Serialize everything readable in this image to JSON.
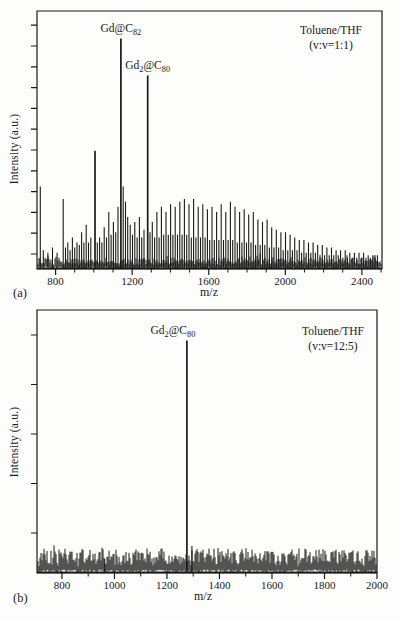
{
  "page": {
    "background": "#fdfdfb",
    "ink": "#1a1a1a",
    "figure_type": "MALDI-TOF mass spectra, two panels"
  },
  "panel_labels": {
    "a": "(a)",
    "b": "(b)"
  },
  "chart_data": [
    {
      "panel": "a",
      "type": "line",
      "kind": "mass-spectrum",
      "xlabel": "m/z",
      "ylabel": "Intensity (a.u.)",
      "xlim": [
        703,
        2505
      ],
      "ylim": [
        0,
        1
      ],
      "x_major_ticks": [
        800,
        1200,
        1600,
        2000,
        2400
      ],
      "x_minor_step": 100,
      "y_tick_count": 12,
      "y_tick_labels": [],
      "grid": false,
      "annotation": {
        "line1": "Toluene/THF",
        "line2": "(v:v=1:1)"
      },
      "labeled_peaks": [
        {
          "mz": 1141,
          "rel_intensity": 0.9,
          "label_text": "Gd@C82",
          "label_segments": [
            [
              "Gd",
              false
            ],
            [
              "@C",
              false
            ],
            [
              "82",
              true
            ]
          ]
        },
        {
          "mz": 1281,
          "rel_intensity": 0.755,
          "label_text": "Gd2@C80",
          "label_segments": [
            [
              "Gd",
              false
            ],
            [
              "2",
              true
            ],
            [
              "@C",
              false
            ],
            [
              "80",
              true
            ]
          ]
        }
      ],
      "noise_level": 0.035,
      "peaks_mz_intensity": [
        [
          720,
          0.32
        ],
        [
          736,
          0.07
        ],
        [
          760,
          0.06
        ],
        [
          784,
          0.08
        ],
        [
          808,
          0.06
        ],
        [
          840,
          0.27
        ],
        [
          852,
          0.08
        ],
        [
          864,
          0.1
        ],
        [
          876,
          0.07
        ],
        [
          888,
          0.12
        ],
        [
          900,
          0.08
        ],
        [
          912,
          0.1
        ],
        [
          924,
          0.09
        ],
        [
          936,
          0.14
        ],
        [
          948,
          0.1
        ],
        [
          960,
          0.17
        ],
        [
          972,
          0.1
        ],
        [
          984,
          0.12
        ],
        [
          1006,
          0.46
        ],
        [
          1018,
          0.1
        ],
        [
          1030,
          0.12
        ],
        [
          1042,
          0.1
        ],
        [
          1054,
          0.16
        ],
        [
          1066,
          0.12
        ],
        [
          1078,
          0.22
        ],
        [
          1090,
          0.13
        ],
        [
          1102,
          0.18
        ],
        [
          1114,
          0.14
        ],
        [
          1126,
          0.24
        ],
        [
          1141,
          0.9
        ],
        [
          1153,
          0.32
        ],
        [
          1165,
          0.26
        ],
        [
          1177,
          0.2
        ],
        [
          1190,
          0.17
        ],
        [
          1202,
          0.13
        ],
        [
          1214,
          0.18
        ],
        [
          1226,
          0.12
        ],
        [
          1238,
          0.2
        ],
        [
          1250,
          0.12
        ],
        [
          1262,
          0.15
        ],
        [
          1281,
          0.755
        ],
        [
          1293,
          0.14
        ],
        [
          1305,
          0.18
        ],
        [
          1317,
          0.12
        ],
        [
          1329,
          0.22
        ],
        [
          1341,
          0.12
        ],
        [
          1353,
          0.24
        ],
        [
          1365,
          0.13
        ],
        [
          1377,
          0.22
        ],
        [
          1389,
          0.13
        ],
        [
          1401,
          0.25
        ],
        [
          1413,
          0.13
        ],
        [
          1425,
          0.24
        ],
        [
          1437,
          0.13
        ],
        [
          1449,
          0.26
        ],
        [
          1461,
          0.13
        ],
        [
          1473,
          0.27
        ],
        [
          1485,
          0.13
        ],
        [
          1497,
          0.25
        ],
        [
          1509,
          0.12
        ],
        [
          1521,
          0.27
        ],
        [
          1533,
          0.12
        ],
        [
          1545,
          0.24
        ],
        [
          1557,
          0.12
        ],
        [
          1569,
          0.25
        ],
        [
          1581,
          0.12
        ],
        [
          1593,
          0.23
        ],
        [
          1605,
          0.11
        ],
        [
          1617,
          0.24
        ],
        [
          1629,
          0.11
        ],
        [
          1641,
          0.22
        ],
        [
          1653,
          0.11
        ],
        [
          1665,
          0.25
        ],
        [
          1677,
          0.11
        ],
        [
          1689,
          0.22
        ],
        [
          1701,
          0.11
        ],
        [
          1713,
          0.26
        ],
        [
          1725,
          0.11
        ],
        [
          1737,
          0.24
        ],
        [
          1749,
          0.1
        ],
        [
          1761,
          0.22
        ],
        [
          1773,
          0.1
        ],
        [
          1785,
          0.23
        ],
        [
          1797,
          0.1
        ],
        [
          1809,
          0.21
        ],
        [
          1821,
          0.1
        ],
        [
          1833,
          0.22
        ],
        [
          1845,
          0.09
        ],
        [
          1857,
          0.19
        ],
        [
          1869,
          0.09
        ],
        [
          1881,
          0.18
        ],
        [
          1893,
          0.09
        ],
        [
          1905,
          0.19
        ],
        [
          1917,
          0.08
        ],
        [
          1929,
          0.16
        ],
        [
          1941,
          0.08
        ],
        [
          1953,
          0.15
        ],
        [
          1965,
          0.08
        ],
        [
          1977,
          0.14
        ],
        [
          1989,
          0.07
        ],
        [
          2001,
          0.14
        ],
        [
          2013,
          0.07
        ],
        [
          2025,
          0.13
        ],
        [
          2037,
          0.07
        ],
        [
          2049,
          0.12
        ],
        [
          2061,
          0.07
        ],
        [
          2073,
          0.11
        ],
        [
          2085,
          0.06
        ],
        [
          2097,
          0.11
        ],
        [
          2109,
          0.06
        ],
        [
          2121,
          0.1
        ],
        [
          2133,
          0.06
        ],
        [
          2145,
          0.1
        ],
        [
          2157,
          0.06
        ],
        [
          2169,
          0.09
        ],
        [
          2181,
          0.05
        ],
        [
          2193,
          0.09
        ],
        [
          2205,
          0.05
        ],
        [
          2217,
          0.08
        ],
        [
          2229,
          0.05
        ],
        [
          2241,
          0.08
        ],
        [
          2253,
          0.05
        ],
        [
          2265,
          0.07
        ],
        [
          2277,
          0.05
        ],
        [
          2289,
          0.07
        ],
        [
          2301,
          0.04
        ],
        [
          2313,
          0.07
        ],
        [
          2325,
          0.04
        ],
        [
          2337,
          0.06
        ],
        [
          2349,
          0.04
        ],
        [
          2361,
          0.06
        ],
        [
          2373,
          0.04
        ],
        [
          2385,
          0.06
        ],
        [
          2397,
          0.04
        ],
        [
          2409,
          0.06
        ],
        [
          2421,
          0.04
        ],
        [
          2433,
          0.05
        ],
        [
          2445,
          0.04
        ],
        [
          2457,
          0.05
        ],
        [
          2469,
          0.04
        ],
        [
          2481,
          0.05
        ]
      ]
    },
    {
      "panel": "b",
      "type": "line",
      "kind": "mass-spectrum",
      "xlabel": "m/z",
      "ylabel": "Intensity (a.u.)",
      "xlim": [
        705,
        2000
      ],
      "ylim": [
        0,
        1
      ],
      "x_major_ticks": [
        800,
        1000,
        1200,
        1400,
        1600,
        1800,
        2000
      ],
      "x_minor_step": 100,
      "y_tick_count": 5,
      "y_tick_labels": [],
      "grid": false,
      "annotation": {
        "line1": "Toluene/THF",
        "line2": "(v:v=12:5)"
      },
      "labeled_peaks": [
        {
          "mz": 1276,
          "rel_intensity": 0.89,
          "label_text": "Gd2@C80",
          "label_segments": [
            [
              "Gd",
              false
            ],
            [
              "2",
              true
            ],
            [
              "@C",
              false
            ],
            [
              "80",
              true
            ]
          ]
        }
      ],
      "noise_level": 0.055,
      "peaks_mz_intensity": [
        [
          963,
          0.05
        ],
        [
          1276,
          0.89
        ],
        [
          1295,
          0.1
        ]
      ]
    }
  ]
}
